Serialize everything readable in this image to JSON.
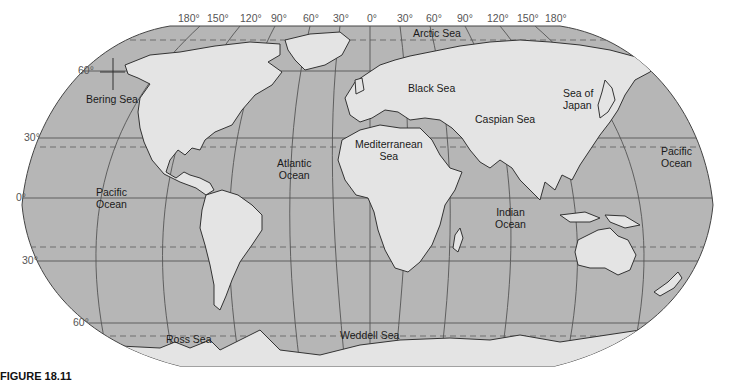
{
  "map": {
    "projection": "Robinson world map",
    "colors": {
      "ocean": "#b6b6b6",
      "land": "#e4e4e4",
      "outline": "#333333",
      "grid": "#555555",
      "tropic_dash": "#666666",
      "background": "#ffffff"
    },
    "longitude_labels": [
      "180°",
      "150°",
      "120°",
      "90°",
      "60°",
      "30°",
      "0°",
      "30°",
      "60°",
      "90°",
      "120°",
      "150°",
      "180°"
    ],
    "latitude_labels": {
      "n60": "60°",
      "n30": "30°",
      "eq": "0°",
      "s30": "30°",
      "s60": "60°"
    },
    "water_labels": {
      "arctic": "Arctic Sea",
      "bering": "Bering Sea",
      "black": "Black Sea",
      "sea_of_japan_1": "Sea of",
      "sea_of_japan_2": "Japan",
      "caspian": "Caspian Sea",
      "mediterranean_1": "Mediterranean",
      "mediterranean_2": "Sea",
      "atlantic_1": "Atlantic",
      "atlantic_2": "Ocean",
      "pacific_w_1": "Pacific",
      "pacific_w_2": "Ocean",
      "pacific_e_1": "Pacific",
      "pacific_e_2": "Ocean",
      "indian_1": "Indian",
      "indian_2": "Ocean",
      "weddell": "Weddell Sea",
      "ross": "Ross Sea"
    }
  },
  "caption": {
    "label": "FIGURE 18.11"
  }
}
